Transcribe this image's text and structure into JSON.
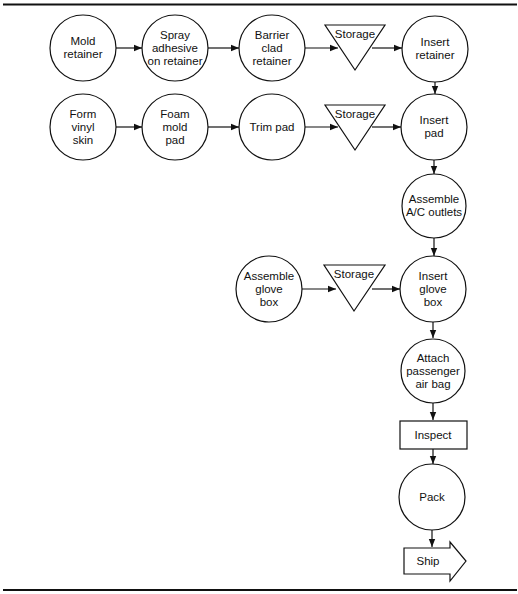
{
  "diagram": {
    "type": "process-flow",
    "nodes": [
      {
        "id": "mold_retainer",
        "shape": "operation",
        "label": "Mold\nretainer"
      },
      {
        "id": "spray_adhesive",
        "shape": "operation",
        "label": "Spray\nadhesive\non retainer"
      },
      {
        "id": "barrier_clad",
        "shape": "operation",
        "label": "Barrier\nclad\nretainer"
      },
      {
        "id": "storage_1",
        "shape": "storage",
        "label": "Storage"
      },
      {
        "id": "insert_retainer",
        "shape": "operation",
        "label": "Insert\nretainer"
      },
      {
        "id": "form_vinyl",
        "shape": "operation",
        "label": "Form\nvinyl\nskin"
      },
      {
        "id": "foam_mold",
        "shape": "operation",
        "label": "Foam\nmold\npad"
      },
      {
        "id": "trim_pad",
        "shape": "operation",
        "label": "Trim pad"
      },
      {
        "id": "storage_2",
        "shape": "storage",
        "label": "Storage"
      },
      {
        "id": "insert_pad",
        "shape": "operation",
        "label": "Insert\npad"
      },
      {
        "id": "assemble_ac",
        "shape": "operation",
        "label": "Assemble\nA/C outlets"
      },
      {
        "id": "assemble_glove",
        "shape": "operation",
        "label": "Assemble\nglove\nbox"
      },
      {
        "id": "storage_3",
        "shape": "storage",
        "label": "Storage"
      },
      {
        "id": "insert_glove",
        "shape": "operation",
        "label": "Insert\nglove\nbox"
      },
      {
        "id": "attach_airbag",
        "shape": "operation",
        "label": "Attach\npassenger\nair bag"
      },
      {
        "id": "inspect",
        "shape": "inspection",
        "label": "Inspect"
      },
      {
        "id": "pack",
        "shape": "operation",
        "label": "Pack"
      },
      {
        "id": "ship",
        "shape": "transport",
        "label": "Ship"
      }
    ],
    "edges": [
      [
        "mold_retainer",
        "spray_adhesive"
      ],
      [
        "spray_adhesive",
        "barrier_clad"
      ],
      [
        "barrier_clad",
        "storage_1"
      ],
      [
        "storage_1",
        "insert_retainer"
      ],
      [
        "insert_retainer",
        "insert_pad"
      ],
      [
        "form_vinyl",
        "foam_mold"
      ],
      [
        "foam_mold",
        "trim_pad"
      ],
      [
        "trim_pad",
        "storage_2"
      ],
      [
        "storage_2",
        "insert_pad"
      ],
      [
        "insert_pad",
        "assemble_ac"
      ],
      [
        "assemble_ac",
        "insert_glove"
      ],
      [
        "assemble_glove",
        "storage_3"
      ],
      [
        "storage_3",
        "insert_glove"
      ],
      [
        "insert_glove",
        "attach_airbag"
      ],
      [
        "attach_airbag",
        "inspect"
      ],
      [
        "inspect",
        "pack"
      ],
      [
        "pack",
        "ship"
      ]
    ]
  },
  "labels": {
    "mold_retainer": "Mold\nretainer",
    "spray_adhesive": "Spray\nadhesive\non retainer",
    "barrier_clad": "Barrier\nclad\nretainer",
    "storage_1": "Storage",
    "insert_retainer": "Insert\nretainer",
    "form_vinyl": "Form\nvinyl\nskin",
    "foam_mold": "Foam\nmold\npad",
    "trim_pad": "Trim pad",
    "storage_2": "Storage",
    "insert_pad": "Insert\npad",
    "assemble_ac": "Assemble\nA/C outlets",
    "assemble_glove": "Assemble\nglove\nbox",
    "storage_3": "Storage",
    "insert_glove": "Insert\nglove\nbox",
    "attach_airbag": "Attach\npassenger\nair bag",
    "inspect": "Inspect",
    "pack": "Pack",
    "ship": "Ship"
  },
  "colors": {
    "stroke": "#111111",
    "background": "#ffffff"
  }
}
